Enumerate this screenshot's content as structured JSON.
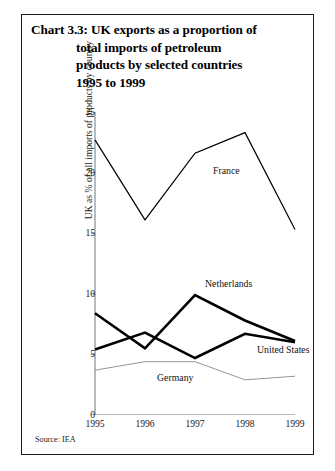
{
  "chart": {
    "title_lines": [
      "Chart 3.3: UK exports as a proportion of",
      "total imports of petroleum",
      "products by selected countries",
      "1995 to 1999"
    ],
    "source": "Source: IEA",
    "ylabel": "UK as % of all imports of products by country",
    "xlabel": "",
    "yticks": [
      "0",
      "5",
      "10",
      "15",
      "20",
      "25"
    ],
    "xticks": [
      "1995",
      "1996",
      "1997",
      "1998",
      "1999"
    ],
    "annotations": {
      "france": "France",
      "netherlands": "Netherlands",
      "united_states": "United States",
      "germany": "Germany"
    }
  },
  "chart_data": {
    "type": "line",
    "title": "Chart 3.3: UK exports as a proportion of total imports of petroleum products by selected countries 1995 to 1999",
    "xlabel": "",
    "ylabel": "UK as % of all imports of products by country",
    "x": [
      1995,
      1996,
      1997,
      1998,
      1999
    ],
    "categories": [
      "1995",
      "1996",
      "1997",
      "1998",
      "1999"
    ],
    "xlim": [
      1995,
      1999
    ],
    "ylim": [
      0,
      25
    ],
    "ytick_values": [
      0,
      5,
      10,
      15,
      20,
      25
    ],
    "grid": false,
    "legend": "inline-annotations",
    "series": [
      {
        "name": "France",
        "values": [
          22.7,
          16.1,
          21.6,
          23.3,
          15.3
        ],
        "color": "#000000",
        "linewidth": 1.2
      },
      {
        "name": "Netherlands",
        "values": [
          8.4,
          5.5,
          9.9,
          7.8,
          6.1
        ],
        "color": "#000000",
        "linewidth": 2.6
      },
      {
        "name": "United States",
        "values": [
          5.4,
          6.8,
          4.7,
          6.7,
          6.0
        ],
        "color": "#000000",
        "linewidth": 2.6
      },
      {
        "name": "Germany",
        "values": [
          3.7,
          4.4,
          4.4,
          2.9,
          3.2
        ],
        "color": "#888888",
        "linewidth": 0.9
      }
    ],
    "source": "Source: IEA"
  }
}
